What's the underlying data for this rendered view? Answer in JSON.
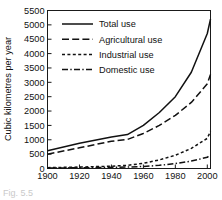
{
  "figure": {
    "caption_fragment": "Fig. 5.5"
  },
  "chart_data": {
    "type": "line",
    "title": "",
    "xlabel": "",
    "ylabel": "Cubic kilometres per year",
    "x": [
      1900,
      1920,
      1940,
      1960,
      1980,
      2000
    ],
    "xlim": [
      1900,
      2002
    ],
    "ylim": [
      0,
      5500
    ],
    "xticks": [
      1900,
      1920,
      1940,
      1960,
      1980,
      2000
    ],
    "xtick_labels": [
      "1900",
      "1920",
      "1940",
      "1960",
      "1980",
      "2000"
    ],
    "yticks": [
      0,
      500,
      1000,
      1500,
      2000,
      2500,
      3000,
      3500,
      4000,
      4500,
      5000,
      5500
    ],
    "ytick_labels": [
      "0",
      "500",
      "1000",
      "1500",
      "2000",
      "2500",
      "3000",
      "3500",
      "4000",
      "4500",
      "5000",
      "5500"
    ],
    "grid": false,
    "legend_position": "upper-left-inside",
    "series": [
      {
        "name": "Total use",
        "style": "solid",
        "x": [
          1900,
          1920,
          1940,
          1950,
          1960,
          1970,
          1980,
          1990,
          2000,
          2002
        ],
        "values": [
          620,
          880,
          1100,
          1180,
          1500,
          1950,
          2500,
          3350,
          4700,
          5200
        ]
      },
      {
        "name": "Agricultural use",
        "style": "long-dash",
        "x": [
          1900,
          1920,
          1940,
          1950,
          1960,
          1970,
          1980,
          1990,
          2000,
          2002
        ],
        "values": [
          500,
          720,
          950,
          1010,
          1220,
          1500,
          1850,
          2300,
          2950,
          3270
        ]
      },
      {
        "name": "Industrial use",
        "style": "short-dash",
        "x": [
          1900,
          1920,
          1940,
          1950,
          1960,
          1970,
          1980,
          1990,
          2000,
          2002
        ],
        "values": [
          30,
          50,
          80,
          110,
          180,
          300,
          460,
          700,
          1050,
          1300
        ]
      },
      {
        "name": "Domestic use",
        "style": "dash-dot",
        "x": [
          1900,
          1920,
          1940,
          1950,
          1960,
          1970,
          1980,
          1990,
          2000,
          2002
        ],
        "values": [
          15,
          25,
          40,
          50,
          70,
          110,
          170,
          260,
          390,
          470
        ]
      }
    ]
  }
}
